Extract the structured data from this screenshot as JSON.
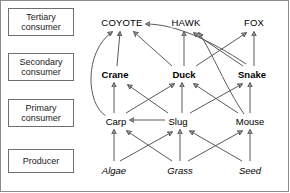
{
  "diagram": {
    "border_color": "#8d8d8d",
    "arrow_color": "#5a5a5a",
    "text_color": "#000000"
  },
  "tiers": [
    {
      "id": "tertiary",
      "label": "Tertiary\nconsumer",
      "x": 8,
      "y": 8,
      "w": 66,
      "h": 28
    },
    {
      "id": "secondary",
      "label": "Secondary\nconsumer",
      "x": 8,
      "y": 53,
      "w": 66,
      "h": 28
    },
    {
      "id": "primary",
      "label": "Primary\nconsumer",
      "x": 8,
      "y": 99,
      "w": 66,
      "h": 28
    },
    {
      "id": "producer",
      "label": "Producer",
      "x": 8,
      "y": 149,
      "w": 66,
      "h": 24
    }
  ],
  "nodes": [
    {
      "id": "coyote",
      "label": "COYOTE",
      "tier": "tertiary",
      "x": 122,
      "y": 22
    },
    {
      "id": "hawk",
      "label": "HAWK",
      "tier": "tertiary",
      "x": 186,
      "y": 22
    },
    {
      "id": "fox",
      "label": "FOX",
      "tier": "tertiary",
      "x": 254,
      "y": 22
    },
    {
      "id": "crane",
      "label": "Crane",
      "tier": "secondary",
      "x": 115,
      "y": 74
    },
    {
      "id": "duck",
      "label": "Duck",
      "tier": "secondary",
      "x": 184,
      "y": 74
    },
    {
      "id": "snake",
      "label": "Snake",
      "tier": "secondary",
      "x": 252,
      "y": 74
    },
    {
      "id": "carp",
      "label": "Carp",
      "tier": "primary",
      "x": 116,
      "y": 121
    },
    {
      "id": "slug",
      "label": "Slug",
      "tier": "primary",
      "x": 178,
      "y": 121
    },
    {
      "id": "mouse",
      "label": "Mouse",
      "tier": "primary",
      "x": 250,
      "y": 121
    },
    {
      "id": "algae",
      "label": "Algae",
      "tier": "producer",
      "x": 114,
      "y": 170
    },
    {
      "id": "grass",
      "label": "Grass",
      "tier": "producer",
      "x": 180,
      "y": 170
    },
    {
      "id": "seed",
      "label": "Seed",
      "tier": "producer",
      "x": 250,
      "y": 170
    }
  ],
  "links": [
    {
      "from": "algae",
      "to": "carp",
      "shape": "line",
      "d": "M114,161 L114,130"
    },
    {
      "from": "algae",
      "to": "slug",
      "shape": "line",
      "d": "M120,161 L172,132"
    },
    {
      "from": "grass",
      "to": "carp",
      "shape": "line",
      "d": "M172,161 L127,131"
    },
    {
      "from": "grass",
      "to": "slug",
      "shape": "line",
      "d": "M180,161 L180,130"
    },
    {
      "from": "grass",
      "to": "mouse",
      "shape": "line",
      "d": "M188,161 L242,131"
    },
    {
      "from": "seed",
      "to": "slug",
      "shape": "line",
      "d": "M242,161 L190,131"
    },
    {
      "from": "seed",
      "to": "mouse",
      "shape": "line",
      "d": "M250,161 L250,130"
    },
    {
      "from": "slug",
      "to": "carp",
      "shape": "line",
      "d": "M165,120 L130,120"
    },
    {
      "from": "carp",
      "to": "crane",
      "shape": "line",
      "d": "M114,113 L114,83"
    },
    {
      "from": "slug",
      "to": "crane",
      "shape": "line",
      "d": "M168,113 L128,85"
    },
    {
      "from": "carp",
      "to": "duck",
      "shape": "line",
      "d": "M126,113 L174,84"
    },
    {
      "from": "slug",
      "to": "duck",
      "shape": "line",
      "d": "M182,113 L182,83"
    },
    {
      "from": "mouse",
      "to": "duck",
      "shape": "line",
      "d": "M238,113 L194,84"
    },
    {
      "from": "slug",
      "to": "snake",
      "shape": "line",
      "d": "M190,113 L242,84"
    },
    {
      "from": "mouse",
      "to": "snake",
      "shape": "line",
      "d": "M250,113 L250,83"
    },
    {
      "from": "carp",
      "to": "coyote",
      "shape": "curve",
      "d": "M106,116 C86,104 84,52 112,32"
    },
    {
      "from": "crane",
      "to": "coyote",
      "shape": "line",
      "d": "M117,66 L120,32"
    },
    {
      "from": "duck",
      "to": "coyote",
      "shape": "line",
      "d": "M172,66 L134,32"
    },
    {
      "from": "snake",
      "to": "coyote",
      "shape": "curve",
      "d": "M246,64 C210,40 175,24 146,24"
    },
    {
      "from": "duck",
      "to": "hawk",
      "shape": "line",
      "d": "M184,66 L184,32"
    },
    {
      "from": "snake",
      "to": "hawk",
      "shape": "line",
      "d": "M243,66 L194,33"
    },
    {
      "from": "mouse",
      "to": "hawk",
      "shape": "curve",
      "d": "M244,114 C226,88 212,52 199,33"
    },
    {
      "from": "duck",
      "to": "fox",
      "shape": "line",
      "d": "M196,66 L246,33"
    },
    {
      "from": "snake",
      "to": "fox",
      "shape": "line",
      "d": "M254,66 L254,32"
    }
  ]
}
